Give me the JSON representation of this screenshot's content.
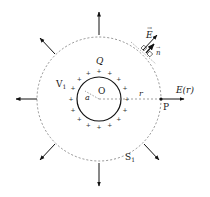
{
  "diagram": {
    "labels": {
      "charge": "Q",
      "volume": "V",
      "volume_sub": "1",
      "radius_inner": "a",
      "center": "O",
      "radius_r": "r",
      "point": "P",
      "field_at_r": "E(r)",
      "surface": "S",
      "surface_sub": "1",
      "field_vector": "E",
      "normal_vector": "n"
    },
    "colors": {
      "stroke": "#111111",
      "dashed": "#777777",
      "text": "#222222"
    },
    "geometry": {
      "center": [
        99,
        99
      ],
      "inner_radius": 22,
      "outer_radius": 62,
      "plus_count": 16
    }
  }
}
